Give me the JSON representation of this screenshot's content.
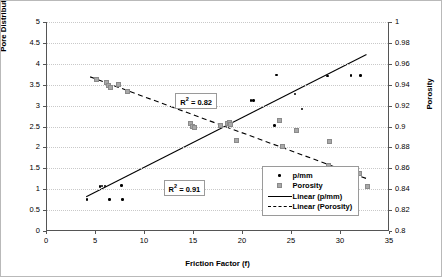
{
  "chart_data": {
    "type": "scatter",
    "title": "",
    "xlabel": "Friction Factor (f)",
    "ylabel": "Pore Distribution (p/mm)",
    "y2label": "Porosity",
    "xlim": [
      0,
      35
    ],
    "ylim": [
      0,
      5
    ],
    "y2lim": [
      0.8,
      1
    ],
    "xticks": [
      "0",
      "5",
      "10",
      "15",
      "20",
      "25",
      "30",
      "35"
    ],
    "yticks": [
      "0",
      "0.5",
      "1",
      "1.5",
      "2",
      "2.5",
      "3",
      "3.5",
      "4",
      "4.5",
      "5"
    ],
    "y2ticks": [
      "0.8",
      "0.82",
      "0.84",
      "0.86",
      "0.88",
      "0.9",
      "0.92",
      "0.94",
      "0.96",
      "0.98",
      "1"
    ],
    "grid": true,
    "legend_position": "lower-right",
    "series": [
      {
        "name": "p/mm",
        "axis": "left",
        "marker": "filled-circle",
        "color": "#000000",
        "points": [
          [
            4.1,
            0.75
          ],
          [
            5.4,
            1.07
          ],
          [
            5.6,
            1.08
          ],
          [
            5.9,
            1.08
          ],
          [
            6.4,
            0.75
          ],
          [
            7.6,
            1.09
          ],
          [
            7.7,
            0.75
          ],
          [
            18.6,
            2.55
          ],
          [
            18.8,
            2.56
          ],
          [
            20.8,
            3.12
          ],
          [
            21.1,
            3.12
          ],
          [
            23.2,
            2.53
          ],
          [
            23.4,
            3.73
          ],
          [
            25.3,
            3.28
          ],
          [
            26.0,
            2.92
          ],
          [
            28.6,
            3.71
          ],
          [
            31.0,
            3.72
          ],
          [
            32.0,
            3.72
          ]
        ]
      },
      {
        "name": "Porosity",
        "axis": "right",
        "marker": "open-square",
        "color": "#a8a8a8",
        "points": [
          [
            5.0,
            0.9455
          ],
          [
            6.0,
            0.9425
          ],
          [
            6.2,
            0.9395
          ],
          [
            6.4,
            0.9385
          ],
          [
            7.2,
            0.9405
          ],
          [
            8.1,
            0.9345
          ],
          [
            14.6,
            0.9035
          ],
          [
            14.8,
            0.9005
          ],
          [
            15.0,
            0.8995
          ],
          [
            17.6,
            0.9015
          ],
          [
            18.3,
            0.9035
          ],
          [
            18.5,
            0.9045
          ],
          [
            18.6,
            0.9025
          ],
          [
            19.3,
            0.8875
          ],
          [
            23.6,
            0.9065
          ],
          [
            25.4,
            0.8965
          ],
          [
            24.0,
            0.8815
          ],
          [
            28.8,
            0.8865
          ],
          [
            28.6,
            0.8635
          ],
          [
            31.8,
            0.8555
          ],
          [
            32.6,
            0.8435
          ]
        ]
      }
    ],
    "trendlines": [
      {
        "name": "Linear (p/mm)",
        "style": "solid",
        "axis": "left",
        "x0": 4.0,
        "y0": 0.82,
        "x1": 32.6,
        "y1": 4.22,
        "r2_label": "R² = 0.91",
        "r2_value": 0.91
      },
      {
        "name": "Linear (Porosity)",
        "style": "dashed",
        "axis": "right",
        "x0": 4.4,
        "y0": 0.9475,
        "x1": 32.8,
        "y1": 0.8495,
        "r2_label": "R² = 0.82",
        "r2_value": 0.82
      }
    ],
    "legend": [
      {
        "label": "p/mm",
        "key": "dot"
      },
      {
        "label": "Porosity",
        "key": "square"
      },
      {
        "label": "Linear (p/mm)",
        "key": "solid-line"
      },
      {
        "label": "Linear (Porosity)",
        "key": "dashed-line"
      }
    ],
    "annotations": [
      {
        "text": "R² = 0.82",
        "x": 13.2,
        "y_left": 3.15
      },
      {
        "text": "R² = 0.91",
        "x": 12.0,
        "y_left": 1.07
      }
    ]
  }
}
